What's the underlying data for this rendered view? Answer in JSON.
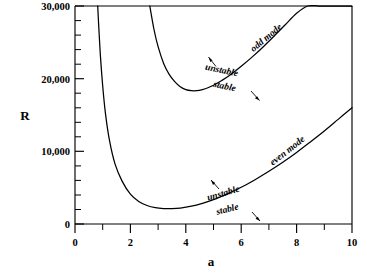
{
  "chart_data": {
    "type": "line",
    "title": "",
    "xlabel": "a",
    "ylabel": "R",
    "xlim": [
      0,
      10
    ],
    "ylim": [
      0,
      30000
    ],
    "grid": false,
    "legend": "none",
    "x_ticks": [
      0,
      2,
      4,
      6,
      8,
      10
    ],
    "x_tick_labels": [
      "0",
      "2",
      "4",
      "6",
      "8",
      "10"
    ],
    "x_minor_ticks": [
      1,
      3,
      5,
      7,
      9
    ],
    "y_ticks": [
      0,
      10000,
      20000,
      30000
    ],
    "y_tick_labels": [
      "0",
      "10,000",
      "20,000",
      "30,000"
    ],
    "y_minor_ticks": [
      2000,
      4000,
      6000,
      8000,
      12000,
      14000,
      16000,
      18000,
      22000,
      24000,
      26000,
      28000
    ],
    "series": [
      {
        "name": "odd mode",
        "label": "odd mode",
        "x": [
          2.7,
          2.85,
          3.0,
          3.2,
          3.4,
          3.6,
          3.8,
          4.0,
          4.2,
          4.4,
          4.6,
          4.8,
          5.0,
          5.3,
          5.6,
          6.0,
          6.4,
          6.8,
          7.2,
          7.6,
          8.0,
          8.4,
          8.8,
          9.2,
          9.6,
          10.0
        ],
        "y": [
          30000,
          26800,
          24400,
          22100,
          20600,
          19600,
          18900,
          18500,
          18350,
          18350,
          18500,
          18750,
          19100,
          19750,
          20500,
          21700,
          23000,
          24400,
          25900,
          27450,
          29000,
          30000,
          30000,
          30000,
          30000,
          30000
        ],
        "annotations": [
          {
            "text": "unstable",
            "side": "above"
          },
          {
            "text": "stable",
            "side": "below"
          }
        ]
      },
      {
        "name": "even mode",
        "label": "even mode",
        "x": [
          0.82,
          0.86,
          0.92,
          1.0,
          1.1,
          1.25,
          1.45,
          1.7,
          2.0,
          2.3,
          2.6,
          2.9,
          3.2,
          3.5,
          3.8,
          4.2,
          4.6,
          5.0,
          5.5,
          6.0,
          6.5,
          7.0,
          7.5,
          8.0,
          8.5,
          9.0,
          9.5,
          10.0
        ],
        "y": [
          30000,
          27000,
          23000,
          19000,
          15200,
          11400,
          8200,
          5900,
          4100,
          3100,
          2550,
          2250,
          2130,
          2120,
          2200,
          2450,
          2850,
          3350,
          4150,
          5050,
          6100,
          7250,
          8500,
          9850,
          11300,
          12800,
          14400,
          16000
        ],
        "annotations": [
          {
            "text": "unstable",
            "side": "above"
          },
          {
            "text": "stable",
            "side": "below"
          }
        ]
      }
    ],
    "annotation_labels": {
      "unstable": "unstable",
      "stable": "stable",
      "odd_mode": "odd mode",
      "even_mode": "even mode"
    },
    "colors": {
      "curve": "#000000",
      "axis": "#000000",
      "background": "#ffffff"
    }
  }
}
